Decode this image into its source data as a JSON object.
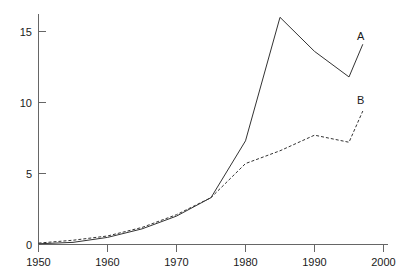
{
  "chart_data": {
    "type": "line",
    "title": "",
    "subtitle": "",
    "xlabel": "",
    "ylabel": "",
    "xlim": [
      1950,
      2000
    ],
    "ylim": [
      0,
      16.2
    ],
    "grid": false,
    "legend_position": "inline-right-end",
    "x_ticks": [
      1950,
      1960,
      1970,
      1980,
      1990,
      2000
    ],
    "x_tick_labels": [
      "1950",
      "1960",
      "1970",
      "1980",
      "1990",
      "2000"
    ],
    "y_ticks": [
      0,
      5,
      10,
      15
    ],
    "y_tick_labels": [
      "0",
      "5",
      "10",
      "15"
    ],
    "series": [
      {
        "name": "A",
        "label": "A",
        "style": "solid",
        "color": "#333333",
        "x": [
          1950,
          1955,
          1960,
          1965,
          1970,
          1975,
          1980,
          1985,
          1990,
          1995,
          1997
        ],
        "values": [
          0.05,
          0.15,
          0.5,
          1.1,
          2.0,
          3.3,
          7.3,
          16.0,
          13.6,
          11.8,
          14.1
        ]
      },
      {
        "name": "B",
        "label": "B",
        "style": "dashed",
        "color": "#333333",
        "x": [
          1950,
          1955,
          1960,
          1965,
          1970,
          1975,
          1980,
          1985,
          1990,
          1995,
          1997
        ],
        "values": [
          0.1,
          0.3,
          0.6,
          1.2,
          2.1,
          3.3,
          5.7,
          6.6,
          7.7,
          7.2,
          9.4
        ]
      }
    ]
  },
  "axes": {
    "x_axis_name": "year-axis",
    "y_axis_name": "value-axis"
  }
}
